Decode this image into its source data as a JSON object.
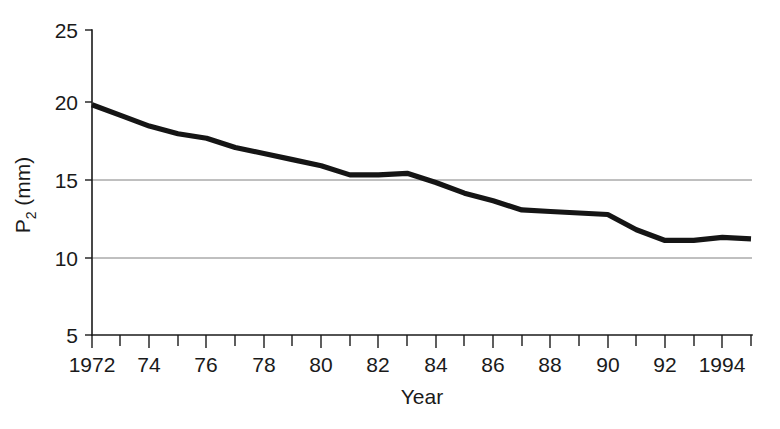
{
  "chart_data": {
    "type": "line",
    "title": "",
    "xlabel": "Year",
    "ylabel": "P2 (mm)",
    "ylabel_base": "P",
    "ylabel_sub": "2",
    "ylabel_unit": " (mm)",
    "xlim": [
      1972,
      1995
    ],
    "ylim": [
      5,
      25
    ],
    "y_ticks": [
      5,
      10,
      15,
      20,
      25
    ],
    "y_tick_labels": [
      "5",
      "10",
      "15",
      "20",
      "25"
    ],
    "x_ticks": [
      1972,
      1974,
      1976,
      1978,
      1980,
      1982,
      1984,
      1986,
      1988,
      1990,
      1992,
      1994
    ],
    "x_tick_labels": [
      "1972",
      "74",
      "76",
      "78",
      "80",
      "82",
      "84",
      "86",
      "88",
      "90",
      "92",
      "1994"
    ],
    "x_minor_ticks": [
      1973,
      1975,
      1977,
      1979,
      1981,
      1983,
      1985,
      1987,
      1989,
      1991,
      1993,
      1995
    ],
    "grid": "horizontal gridlines at y = 10 and y = 15 only",
    "gridlines": [
      10,
      15
    ],
    "legend": "none",
    "legend_position": "none",
    "line_color": "#151515",
    "axis_color": "#1a1a1a",
    "grid_color": "#808080",
    "series": [
      {
        "name": "P2",
        "x": [
          1972,
          1973,
          1974,
          1975,
          1976,
          1977,
          1978,
          1979,
          1980,
          1981,
          1982,
          1983,
          1984,
          1985,
          1986,
          1987,
          1988,
          1989,
          1990,
          1991,
          1992,
          1993,
          1994,
          1995
        ],
        "values": [
          20.1,
          19.4,
          18.7,
          18.2,
          17.9,
          17.3,
          16.9,
          16.5,
          16.1,
          15.5,
          15.5,
          15.6,
          15.0,
          14.3,
          13.8,
          13.2,
          13.1,
          13.0,
          12.9,
          11.9,
          11.2,
          11.2,
          11.4,
          11.3
        ]
      }
    ]
  }
}
